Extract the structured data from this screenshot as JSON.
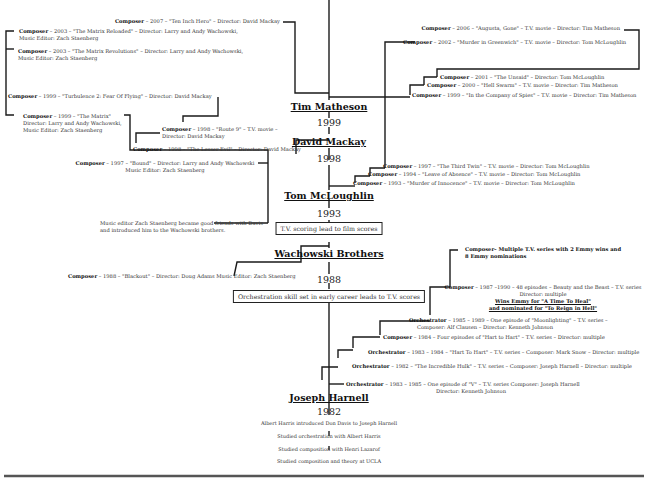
{
  "timeline": {
    "nodes": [
      {
        "name": "Tim Matheson",
        "year": "1999"
      },
      {
        "name": "David Mackay",
        "year": "1998"
      },
      {
        "name": "Tom McLoughlin",
        "year": "1993"
      },
      {
        "name": "Wachowski Brothers",
        "year": "1988"
      },
      {
        "name": "Joseph Harnell",
        "year": "1982"
      }
    ],
    "boxes": [
      "T.V. scoring lead to film scores",
      "Orchestration skill set in early career leads to T.V. scores"
    ],
    "origins": [
      "Albert Harris introduced Don Davis to Joseph Harnell",
      "Studied orchestration with Albert Harris",
      "Studied composition with Henri Lazarof",
      "Studied composition and theory at UCLA"
    ]
  },
  "credits": {
    "ten_inch_hero": {
      "role": "Composer",
      "text": " – 2007 – \"Ten Inch Hero\" – Director: David Mackay"
    },
    "matrix_reloaded": {
      "role": "Composer",
      "text": " – 2003 – \"The Matrix Reloaded\" – Director: Larry and Andy Wachowski,",
      "line2": "Music Editor: Zach Staenberg"
    },
    "matrix_revolutions": {
      "role": "Composer",
      "text": " – 2003 – \"The Matrix Revolutions\" – Director: Larry and Andy Wachowski,",
      "line2": "Music Editor: Zach Staenberg"
    },
    "turbulence2": {
      "role": "Composer",
      "text": " – 1999 – \"Turbulence 2: Fear Of Flying\" – Director: David Mackay"
    },
    "matrix": {
      "role": "Composer",
      "text": " – 1999 – \"The Matrix\"",
      "line2": "Director: Larry and Andy Wachowski,",
      "line3": "Music Editor: Zach Staenberg"
    },
    "route9": {
      "role": "Composer",
      "text": " – 1998 – \"Route 9\" – T.V. movie –",
      "line2": "Director: David Mackay"
    },
    "lesser_evil": {
      "role": "Composer",
      "text": " – 1998 – \"The Lesser Evil\" – Director: David Mackay"
    },
    "bound": {
      "role": "Composer",
      "text": " – 1997 – \"Bound\" – Director: Larry and Andy Wachowski",
      "line2": "Music Editor: Zach Staenberg"
    },
    "augusta_gone": {
      "role": "Composer",
      "text": " – 2006 – \"Augusta, Gone\" – T.V. movie – Director: Tim Matheson"
    },
    "murder_greenwich": {
      "role": "Composer",
      "text": " – 2002 – \"Murder in Greenwich\" – T.V. movie – Director: Tom McLoughlin"
    },
    "unsaid": {
      "role": "Composer",
      "text": " – 2001 – \"The Unsaid\" – Director: Tom McLoughlin"
    },
    "hell_swarm": {
      "role": "Composer",
      "text": " – 2000 – \"Hell Swarm\" – T.V. movie – Director: Tim Matheson"
    },
    "company_spies": {
      "role": "Composer",
      "text": " – 1999 – \"In the Company of Spies\" – T.V. movie – Director: Tim Matheson"
    },
    "third_twin": {
      "role": "Composer",
      "text": " – 1997 – \"The Third Twin\" – T.V. movie – Director: Tom McLoughlin"
    },
    "leave_absence": {
      "role": "Composer",
      "text": " – 1994 – \"Leave of Absence\" – T.V. movie – Director: Tom McLoughlin"
    },
    "murder_innocence": {
      "role": "Composer",
      "text": " – 1993 – \"Murder of Innocence\" – T.V. movie – Director: Tom McLoughlin"
    },
    "staenberg_note": {
      "line1": "Music editor Zach Staenberg became good friends with Davis",
      "line2": "and introduced him to the Wachowski brothers."
    },
    "blackout": {
      "role": "Composer",
      "text": " – 1988 – \"Blackout\" – Director: Doug Adams Music Editor: Zach Staenberg"
    },
    "emmy_summary": {
      "role": "Composer– Multiple T.V. series with 2 Emmy wins and",
      "line2": "8 Emmy nominations"
    },
    "beauty_beast": {
      "role": "Composer",
      "text": " – 1987 –1990 – 48 episodes – Beauty and the Beast – T.V. series",
      "line2": "Director: multiple",
      "line3": "Wins Emmy for \"A Time To Heal\"",
      "line4": "and nominated for \"To Reign in Hell\""
    },
    "moonlighting": {
      "role": "Orchestrator",
      "text": " – 1985 – 1989 – One episode of \"Moonlighting\" – T.V. series –",
      "line2": "Composer: Alf Clausen – Director: Kenneth Johnson"
    },
    "hart_four": {
      "role": "Composer",
      "text": " – 1984 – Four episodes of \"Hart to Hart\" – T.V. series – Director: multiple"
    },
    "hart_orch": {
      "role": "Orchestrator",
      "text": " – 1983 – 1984 – \"Hart To Hart\" – T.V. series – Composer: Mark Snow – Director: multiple"
    },
    "hulk": {
      "role": "Orchestrator",
      "text": " – 1982 – \"The Incredible Hulk\" – T.V. series – Composer: Joseph Harnell – Director: multiple"
    },
    "v_series": {
      "role": "Orchestrator",
      "text": " – 1983 – 1985 – One episode of \"V\" – T.V. series  Composer: Joseph Harnell",
      "line2": "Director: Kenneth Johnson"
    }
  }
}
